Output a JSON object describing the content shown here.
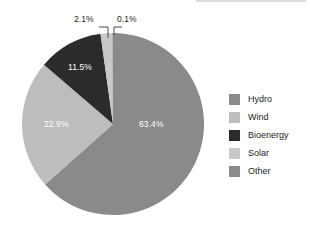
{
  "chart_data": {
    "type": "pie",
    "title": "",
    "subtitle": "",
    "xlabel": "",
    "ylabel": "",
    "categories": [
      "Hydro",
      "Wind",
      "Bioenergy",
      "Solar",
      "Other"
    ],
    "values": [
      63.4,
      22.9,
      11.5,
      2.1,
      0.1
    ],
    "value_unit": "%",
    "data_labels": [
      "63.4%",
      "22.9%",
      "11.5%",
      "2.1%",
      "0.1%"
    ],
    "colors": [
      "#8a8a8a",
      "#bdbdbd",
      "#2b2b2b",
      "#c8c8c8",
      "#8a8a8a"
    ],
    "label_colors": [
      "#ffffff",
      "#ffffff",
      "#ffffff",
      "#1d1d1d",
      "#1d1d1d"
    ],
    "label_placement": [
      "inside",
      "inside",
      "inside",
      "outside-leader",
      "outside-leader"
    ],
    "start_angle_deg": 0,
    "direction": "clockwise",
    "legend_position": "right",
    "grid": false,
    "background": "#ffffff",
    "slices": [
      {
        "name": "Hydro",
        "value": 63.4,
        "label": "63.4%",
        "color": "#8a8a8a"
      },
      {
        "name": "Wind",
        "value": 22.9,
        "label": "22.9%",
        "color": "#bdbdbd"
      },
      {
        "name": "Bioenergy",
        "value": 11.5,
        "label": "11.5%",
        "color": "#2b2b2b"
      },
      {
        "name": "Solar",
        "value": 2.1,
        "label": "2.1%",
        "color": "#c8c8c8"
      },
      {
        "name": "Other",
        "value": 0.1,
        "label": "0.1%",
        "color": "#8a8a8a"
      }
    ]
  },
  "labels": {
    "hydro": "63.4%",
    "wind": "22.9%",
    "bioenergy": "11.5%",
    "solar": "2.1%",
    "other": "0.1%"
  },
  "legend": {
    "items": [
      {
        "label": "Hydro",
        "color": "#8a8a8a"
      },
      {
        "label": "Wind",
        "color": "#bdbdbd"
      },
      {
        "label": "Bioenergy",
        "color": "#2b2b2b"
      },
      {
        "label": "Solar",
        "color": "#c8c8c8"
      },
      {
        "label": "Other",
        "color": "#8a8a8a"
      }
    ]
  },
  "geometry": {
    "center_x": 113,
    "center_y": 124,
    "radius": 91
  }
}
